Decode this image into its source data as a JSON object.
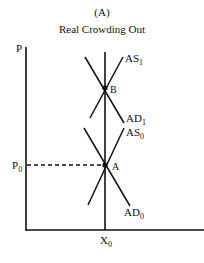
{
  "figure": {
    "panel_label": "(A)",
    "title": "Real Crowding Out"
  },
  "axes": {
    "y_label": "P",
    "x_label": "X",
    "x_label_sub": "0",
    "p0_label": "P",
    "p0_sub": "0"
  },
  "curves": {
    "as1": {
      "label": "AS",
      "sub": "1"
    },
    "ad1": {
      "label": "AD",
      "sub": "1"
    },
    "as0": {
      "label": "AS",
      "sub": "0"
    },
    "ad0": {
      "label": "AD",
      "sub": "0"
    }
  },
  "points": {
    "b": "B",
    "a": "A"
  },
  "colors": {
    "line": "#111111",
    "background": "#ffffff"
  }
}
